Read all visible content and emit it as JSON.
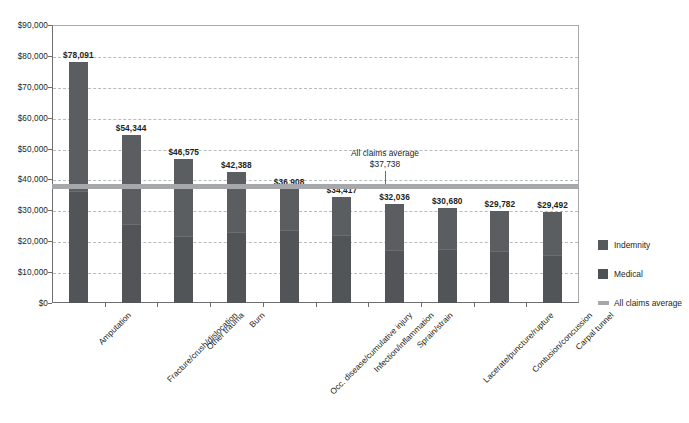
{
  "chart_data": {
    "type": "bar",
    "subtype": "stacked-column",
    "title": "",
    "xlabel": "",
    "ylabel": "",
    "ylim": [
      0,
      90000
    ],
    "ytick_step": 10000,
    "ytick_labels": [
      "$0",
      "$10,000",
      "$20,000",
      "$30,000",
      "$40,000",
      "$50,000",
      "$60,000",
      "$70,000",
      "$80,000",
      "$90,000"
    ],
    "grid": true,
    "legend_position": "right",
    "categories": [
      "Amputation",
      "Fracture/crush/dislocation",
      "Other trauma",
      "Burn",
      "Occ. disease/cumulative injury",
      "Infection/inflammation",
      "Sprain/strain",
      "Lacerate/puncture/rupture",
      "Contusion/concussion",
      "Carpal tunnel"
    ],
    "values": [
      78091,
      54344,
      46575,
      42388,
      36908,
      34417,
      32036,
      30680,
      29782,
      29492
    ],
    "value_labels": [
      "$78,091",
      "$54,344",
      "$46,575",
      "$42,388",
      "$36,908",
      "$34,417",
      "$32,036",
      "$30,680",
      "$29,782",
      "$29,492"
    ],
    "series": [
      {
        "name": "Indemnity",
        "color": "#5a5e60",
        "values": [
          42000,
          29000,
          25000,
          19500,
          13500,
          12500,
          15000,
          13500,
          13000,
          14000
        ]
      },
      {
        "name": "Medical",
        "color": "#515557",
        "values": [
          36091,
          25344,
          21575,
          22888,
          23408,
          21917,
          17036,
          17180,
          16782,
          15492
        ]
      }
    ],
    "reference_line": {
      "label": "All claims average",
      "value": 37738,
      "value_label": "$37,738",
      "color": "#a6a8ab"
    }
  },
  "legend": {
    "items": [
      {
        "label": "Indemnity",
        "swatch": "indemnity-swatch"
      },
      {
        "label": "Medical",
        "swatch": "medical-swatch"
      },
      {
        "label": "All claims average",
        "swatch": "average-line-swatch"
      }
    ]
  }
}
